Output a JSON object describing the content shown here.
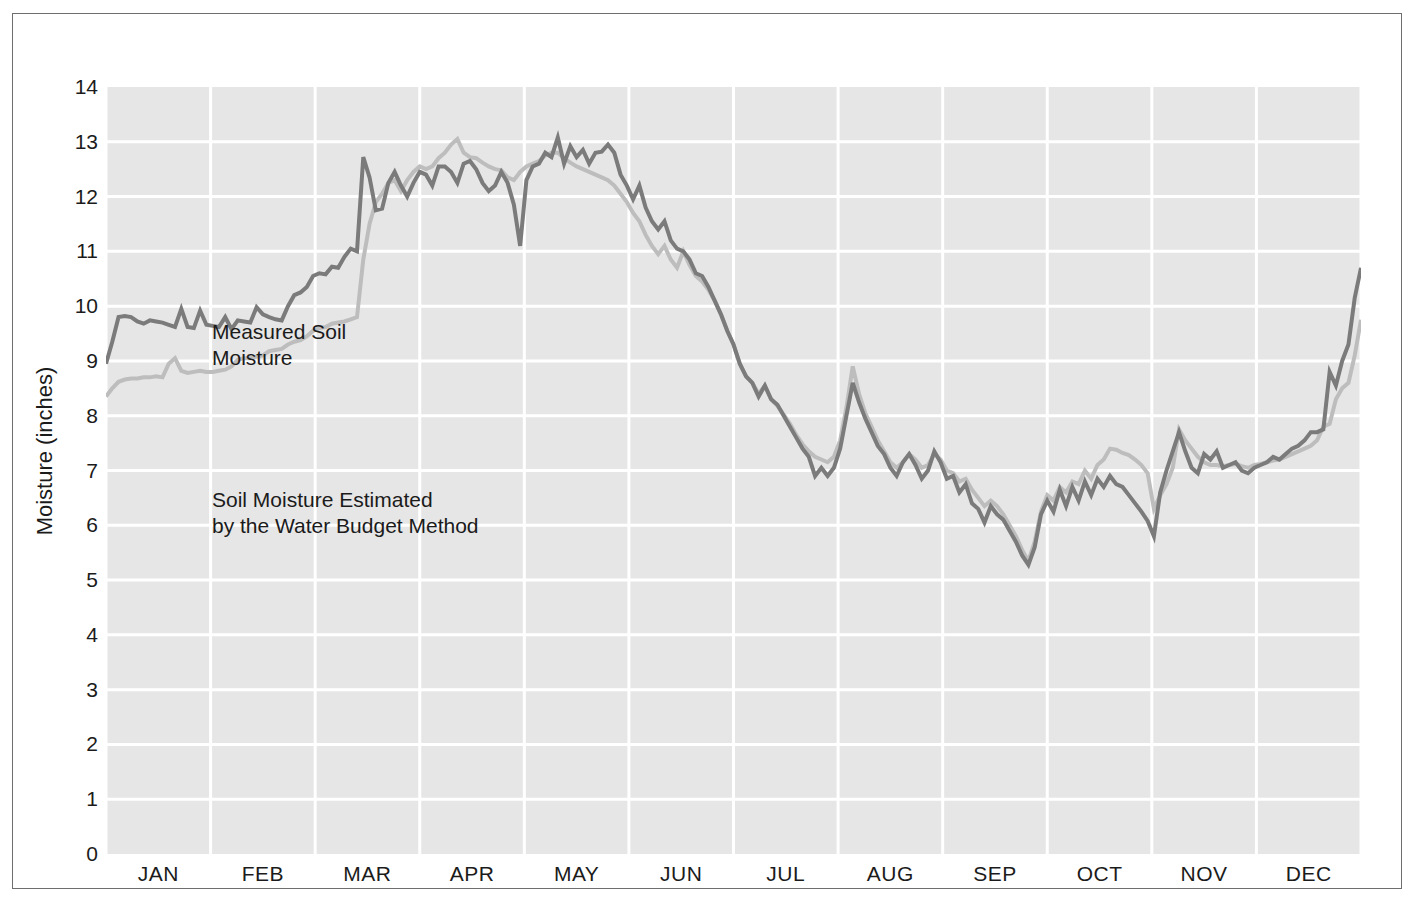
{
  "chart_data": {
    "type": "line",
    "title": "",
    "xlabel": "",
    "ylabel": "Moisture (inches)",
    "ylim": [
      0,
      14
    ],
    "ytick_labels": [
      "14",
      "13",
      "12",
      "11",
      "10",
      "9",
      "8",
      "7",
      "6",
      "5",
      "4",
      "3",
      "2",
      "1",
      "0"
    ],
    "ytick_values": [
      14,
      13,
      12,
      11,
      10,
      9,
      8,
      7,
      6,
      5,
      4,
      3,
      2,
      1,
      0
    ],
    "categories": [
      "JAN",
      "FEB",
      "MAR",
      "APR",
      "MAY",
      "JUN",
      "JUL",
      "AUG",
      "SEP",
      "OCT",
      "NOV",
      "DEC"
    ],
    "xlim": [
      0,
      12
    ],
    "grid": true,
    "legend_position": "inline-annotation",
    "annotations": [
      {
        "name": "measured-label",
        "text": "Measured Soil\nMoisture",
        "x_month": 0.12,
        "y_value": 10.9
      },
      {
        "name": "estimated-label",
        "text": "Soil Moisture Estimated\nby the Water Budget Method",
        "x_month": 0.12,
        "y_value": 7.9
      }
    ],
    "series": [
      {
        "name": "Measured Soil Moisture",
        "color": "#7b7b7b",
        "linewidth": 4,
        "x": [
          0.0,
          0.06,
          0.12,
          0.18,
          0.24,
          0.3,
          0.36,
          0.42,
          0.48,
          0.54,
          0.6,
          0.66,
          0.72,
          0.78,
          0.84,
          0.9,
          0.96,
          1.02,
          1.08,
          1.14,
          1.2,
          1.26,
          1.32,
          1.38,
          1.44,
          1.5,
          1.56,
          1.62,
          1.68,
          1.74,
          1.8,
          1.86,
          1.92,
          1.98,
          2.04,
          2.1,
          2.16,
          2.22,
          2.28,
          2.34,
          2.4,
          2.46,
          2.52,
          2.58,
          2.64,
          2.7,
          2.76,
          2.82,
          2.88,
          2.94,
          3.0,
          3.06,
          3.12,
          3.18,
          3.24,
          3.3,
          3.36,
          3.42,
          3.48,
          3.54,
          3.6,
          3.66,
          3.72,
          3.78,
          3.84,
          3.9,
          3.96,
          4.02,
          4.08,
          4.14,
          4.2,
          4.26,
          4.32,
          4.38,
          4.44,
          4.5,
          4.56,
          4.62,
          4.68,
          4.74,
          4.8,
          4.86,
          4.92,
          4.98,
          5.04,
          5.1,
          5.16,
          5.22,
          5.28,
          5.34,
          5.4,
          5.46,
          5.52,
          5.58,
          5.64,
          5.7,
          5.76,
          5.82,
          5.88,
          5.94,
          6.0,
          6.06,
          6.12,
          6.18,
          6.24,
          6.3,
          6.36,
          6.42,
          6.48,
          6.54,
          6.6,
          6.66,
          6.72,
          6.78,
          6.84,
          6.9,
          6.96,
          7.02,
          7.08,
          7.14,
          7.2,
          7.26,
          7.32,
          7.38,
          7.44,
          7.5,
          7.56,
          7.62,
          7.68,
          7.74,
          7.8,
          7.86,
          7.92,
          7.98,
          8.04,
          8.1,
          8.16,
          8.22,
          8.28,
          8.34,
          8.4,
          8.46,
          8.52,
          8.58,
          8.64,
          8.7,
          8.76,
          8.82,
          8.88,
          8.94,
          9.0,
          9.06,
          9.12,
          9.18,
          9.24,
          9.3,
          9.36,
          9.42,
          9.48,
          9.54,
          9.6,
          9.66,
          9.72,
          9.78,
          9.84,
          9.9,
          9.96,
          10.02,
          10.08,
          10.14,
          10.2,
          10.26,
          10.32,
          10.38,
          10.44,
          10.5,
          10.56,
          10.62,
          10.68,
          10.74,
          10.8,
          10.86,
          10.92,
          10.98,
          11.04,
          11.1,
          11.16,
          11.22,
          11.28,
          11.34,
          11.4,
          11.46,
          11.52,
          11.58,
          11.64,
          11.7,
          11.76,
          11.82,
          11.88,
          11.94,
          12.0
        ],
        "y": [
          8.95,
          9.35,
          9.8,
          9.82,
          9.8,
          9.72,
          9.68,
          9.74,
          9.72,
          9.7,
          9.66,
          9.62,
          9.95,
          9.62,
          9.6,
          9.92,
          9.66,
          9.64,
          9.62,
          9.8,
          9.58,
          9.74,
          9.72,
          9.7,
          9.98,
          9.85,
          9.8,
          9.76,
          9.74,
          10.0,
          10.2,
          10.25,
          10.35,
          10.55,
          10.6,
          10.58,
          10.72,
          10.7,
          10.9,
          11.05,
          11.0,
          12.72,
          12.35,
          11.75,
          11.78,
          12.25,
          12.45,
          12.2,
          12.0,
          12.25,
          12.45,
          12.4,
          12.2,
          12.55,
          12.55,
          12.45,
          12.25,
          12.6,
          12.65,
          12.5,
          12.25,
          12.1,
          12.2,
          12.45,
          12.25,
          11.85,
          11.1,
          12.3,
          12.55,
          12.6,
          12.8,
          12.72,
          13.08,
          12.6,
          12.92,
          12.72,
          12.85,
          12.6,
          12.8,
          12.82,
          12.95,
          12.8,
          12.4,
          12.2,
          11.95,
          12.2,
          11.8,
          11.55,
          11.4,
          11.55,
          11.2,
          11.05,
          11.0,
          10.85,
          10.6,
          10.55,
          10.35,
          10.1,
          9.85,
          9.55,
          9.3,
          8.95,
          8.72,
          8.6,
          8.35,
          8.55,
          8.3,
          8.2,
          8.0,
          7.8,
          7.6,
          7.4,
          7.25,
          6.9,
          7.05,
          6.9,
          7.05,
          7.4,
          8.0,
          8.6,
          8.25,
          7.95,
          7.7,
          7.45,
          7.3,
          7.05,
          6.9,
          7.15,
          7.3,
          7.1,
          6.85,
          7.0,
          7.35,
          7.15,
          6.85,
          6.9,
          6.6,
          6.75,
          6.4,
          6.3,
          6.05,
          6.35,
          6.2,
          6.1,
          5.9,
          5.7,
          5.45,
          5.28,
          5.6,
          6.2,
          6.45,
          6.25,
          6.65,
          6.35,
          6.7,
          6.45,
          6.8,
          6.55,
          6.85,
          6.7,
          6.9,
          6.75,
          6.7,
          6.55,
          6.4,
          6.25,
          6.08,
          5.8,
          6.6,
          7.0,
          7.35,
          7.7,
          7.35,
          7.05,
          6.95,
          7.3,
          7.2,
          7.35,
          7.05,
          7.1,
          7.15,
          7.0,
          6.95,
          7.05,
          7.1,
          7.15,
          7.25,
          7.2,
          7.3,
          7.4,
          7.45,
          7.55,
          7.7,
          7.7,
          7.75,
          8.8,
          8.55,
          9.0,
          9.3,
          10.15,
          10.7
        ]
      },
      {
        "name": "Soil Moisture Estimated by the Water Budget Method",
        "color": "#bdbdbd",
        "linewidth": 4,
        "x": [
          0.0,
          0.06,
          0.12,
          0.18,
          0.24,
          0.3,
          0.36,
          0.42,
          0.48,
          0.54,
          0.6,
          0.66,
          0.72,
          0.78,
          0.84,
          0.9,
          0.96,
          1.02,
          1.08,
          1.14,
          1.2,
          1.26,
          1.32,
          1.38,
          1.44,
          1.5,
          1.56,
          1.62,
          1.68,
          1.74,
          1.8,
          1.86,
          1.92,
          1.98,
          2.04,
          2.1,
          2.16,
          2.22,
          2.28,
          2.34,
          2.4,
          2.46,
          2.52,
          2.58,
          2.64,
          2.7,
          2.76,
          2.82,
          2.88,
          2.94,
          3.0,
          3.06,
          3.12,
          3.18,
          3.24,
          3.3,
          3.36,
          3.42,
          3.48,
          3.54,
          3.6,
          3.66,
          3.72,
          3.78,
          3.84,
          3.9,
          3.96,
          4.02,
          4.08,
          4.14,
          4.2,
          4.26,
          4.32,
          4.38,
          4.44,
          4.5,
          4.56,
          4.62,
          4.68,
          4.74,
          4.8,
          4.86,
          4.92,
          4.98,
          5.04,
          5.1,
          5.16,
          5.22,
          5.28,
          5.34,
          5.4,
          5.46,
          5.52,
          5.58,
          5.64,
          5.7,
          5.76,
          5.82,
          5.88,
          5.94,
          6.0,
          6.06,
          6.12,
          6.18,
          6.24,
          6.3,
          6.36,
          6.42,
          6.48,
          6.54,
          6.6,
          6.66,
          6.72,
          6.78,
          6.84,
          6.9,
          6.96,
          7.02,
          7.08,
          7.14,
          7.2,
          7.26,
          7.32,
          7.38,
          7.44,
          7.5,
          7.56,
          7.62,
          7.68,
          7.74,
          7.8,
          7.86,
          7.92,
          7.98,
          8.04,
          8.1,
          8.16,
          8.22,
          8.28,
          8.34,
          8.4,
          8.46,
          8.52,
          8.58,
          8.64,
          8.7,
          8.76,
          8.82,
          8.88,
          8.94,
          9.0,
          9.06,
          9.12,
          9.18,
          9.24,
          9.3,
          9.36,
          9.42,
          9.48,
          9.54,
          9.6,
          9.66,
          9.72,
          9.78,
          9.84,
          9.9,
          9.96,
          10.02,
          10.08,
          10.14,
          10.2,
          10.26,
          10.32,
          10.38,
          10.44,
          10.5,
          10.56,
          10.62,
          10.68,
          10.74,
          10.8,
          10.86,
          10.92,
          10.98,
          11.04,
          11.1,
          11.16,
          11.22,
          11.28,
          11.34,
          11.4,
          11.46,
          11.52,
          11.58,
          11.64,
          11.7,
          11.76,
          11.82,
          11.88,
          11.94,
          12.0
        ],
        "y": [
          8.35,
          8.5,
          8.62,
          8.66,
          8.68,
          8.68,
          8.7,
          8.7,
          8.72,
          8.7,
          8.95,
          9.05,
          8.82,
          8.78,
          8.8,
          8.82,
          8.8,
          8.8,
          8.82,
          8.84,
          8.9,
          9.02,
          9.05,
          9.05,
          9.08,
          9.1,
          9.18,
          9.2,
          9.22,
          9.3,
          9.35,
          9.38,
          9.45,
          9.55,
          9.6,
          9.62,
          9.68,
          9.7,
          9.72,
          9.76,
          9.8,
          10.85,
          11.5,
          11.9,
          12.05,
          12.25,
          12.3,
          12.1,
          12.3,
          12.45,
          12.55,
          12.5,
          12.55,
          12.7,
          12.8,
          12.95,
          13.05,
          12.8,
          12.72,
          12.7,
          12.62,
          12.55,
          12.5,
          12.48,
          12.35,
          12.3,
          12.45,
          12.55,
          12.6,
          12.65,
          12.75,
          12.8,
          12.8,
          12.7,
          12.62,
          12.55,
          12.5,
          12.45,
          12.4,
          12.35,
          12.3,
          12.2,
          12.05,
          11.9,
          11.7,
          11.55,
          11.3,
          11.1,
          10.95,
          11.1,
          10.85,
          10.7,
          11.0,
          10.75,
          10.55,
          10.45,
          10.3,
          10.1,
          9.85,
          9.55,
          9.3,
          8.95,
          8.72,
          8.6,
          8.4,
          8.55,
          8.3,
          8.18,
          8.02,
          7.85,
          7.65,
          7.48,
          7.35,
          7.25,
          7.2,
          7.15,
          7.25,
          7.55,
          8.15,
          8.9,
          8.4,
          8.05,
          7.8,
          7.55,
          7.35,
          7.15,
          7.05,
          7.15,
          7.3,
          7.2,
          7.05,
          7.1,
          7.3,
          7.2,
          7.0,
          6.95,
          6.8,
          6.85,
          6.65,
          6.5,
          6.35,
          6.45,
          6.35,
          6.2,
          6.0,
          5.8,
          5.55,
          5.35,
          5.7,
          6.25,
          6.55,
          6.45,
          6.7,
          6.6,
          6.8,
          6.75,
          7.0,
          6.85,
          7.1,
          7.2,
          7.4,
          7.38,
          7.32,
          7.28,
          7.2,
          7.1,
          6.95,
          6.3,
          6.55,
          6.75,
          7.05,
          7.75,
          7.55,
          7.4,
          7.25,
          7.15,
          7.1,
          7.1,
          7.08,
          7.1,
          7.12,
          7.08,
          7.05,
          7.1,
          7.12,
          7.15,
          7.18,
          7.2,
          7.25,
          7.3,
          7.35,
          7.4,
          7.45,
          7.55,
          7.8,
          7.85,
          8.3,
          8.5,
          8.6,
          9.1,
          9.75
        ]
      }
    ],
    "colors": {
      "plot_background": "#e6e6e6",
      "gridline": "#ffffff",
      "frame_border": "#6e6e6e",
      "text": "#1b1b1b",
      "measured_series": "#7b7b7b",
      "estimated_series": "#bdbdbd"
    }
  }
}
